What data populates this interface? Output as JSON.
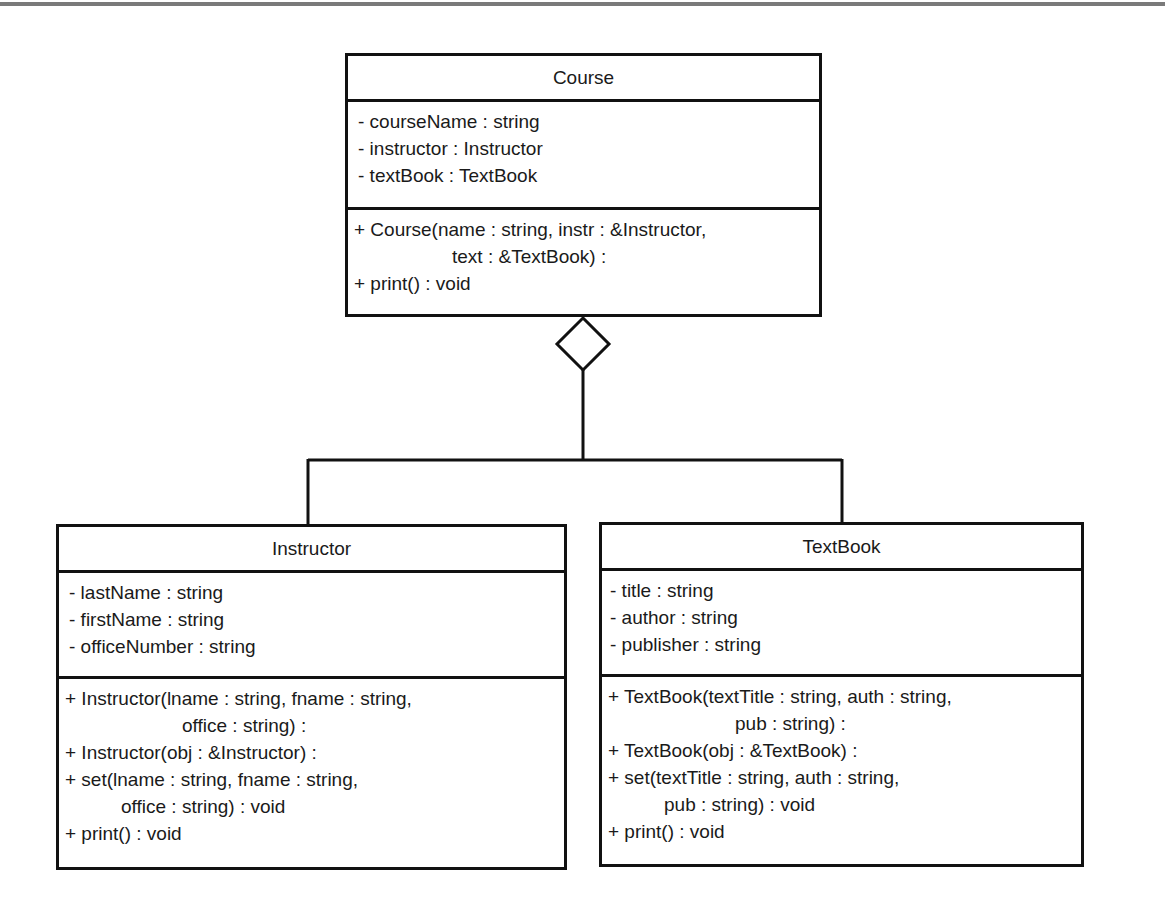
{
  "diagram": {
    "relationship": "aggregation",
    "classes": {
      "course": {
        "name": "Course",
        "attributes": [
          "- courseName : string",
          "- instructor : Instructor",
          "- textBook : TextBook"
        ],
        "methods": [
          "+ Course(name : string, instr : &Instructor,",
          "text : &TextBook) :",
          "+ print() : void"
        ]
      },
      "instructor": {
        "name": "Instructor",
        "attributes": [
          "- lastName : string",
          "- firstName : string",
          "- officeNumber : string"
        ],
        "methods": [
          "+ Instructor(lname : string, fname : string,",
          "office : string) :",
          "+ Instructor(obj : &Instructor) :",
          "+ set(lname : string, fname : string,",
          "office : string) : void",
          "+ print() : void"
        ]
      },
      "textbook": {
        "name": "TextBook",
        "attributes": [
          "- title : string",
          "- author : string",
          "- publisher : string"
        ],
        "methods": [
          "+ TextBook(textTitle : string, auth : string,",
          "pub : string) :",
          "+ TextBook(obj : &TextBook) :",
          "+ set(textTitle : string, auth : string,",
          "pub : string) : void",
          "+ print() : void"
        ]
      }
    }
  }
}
